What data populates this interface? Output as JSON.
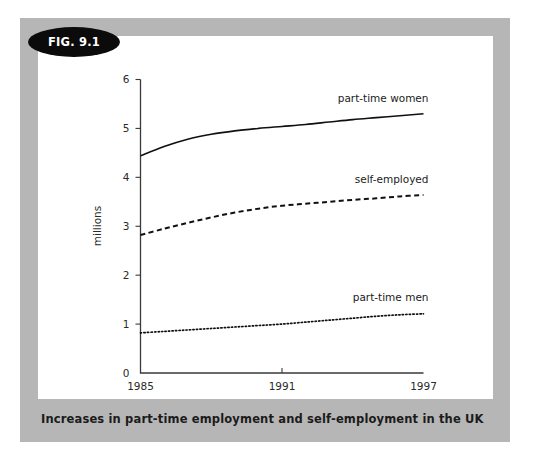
{
  "figure": {
    "badge_label": "FIG. 9.1",
    "caption": "Increases in part-time employment and self-employment in the UK",
    "frame_color": "#b6b6b6",
    "panel_color": "#ffffff",
    "badge_color": "#0b0b0b"
  },
  "chart_data": {
    "type": "line",
    "title": "Increases in part-time employment and self-employment in the UK",
    "xlabel": "",
    "ylabel": "millions",
    "x": [
      1985,
      1986,
      1987,
      1988,
      1989,
      1990,
      1991,
      1992,
      1993,
      1994,
      1995,
      1996,
      1997
    ],
    "xlim": [
      1985,
      1997
    ],
    "ylim": [
      0,
      6
    ],
    "xticks": [
      1985,
      1991,
      1997
    ],
    "xtick_labels": [
      "1985",
      "1991",
      "1997"
    ],
    "yticks": [
      0,
      1,
      2,
      3,
      4,
      5,
      6
    ],
    "ytick_labels": [
      "0",
      "1",
      "2",
      "3",
      "4",
      "5",
      "6"
    ],
    "grid": false,
    "legend": "inline-labels",
    "series": [
      {
        "name": "part-time women",
        "label": "part-time women",
        "style": "solid",
        "color": "#101010",
        "values": [
          4.44,
          4.63,
          4.78,
          4.88,
          4.95,
          5.0,
          5.04,
          5.08,
          5.13,
          5.18,
          5.22,
          5.26,
          5.3
        ]
      },
      {
        "name": "self-employed",
        "label": "self-employed",
        "style": "dashed",
        "color": "#101010",
        "values": [
          2.82,
          2.95,
          3.07,
          3.18,
          3.28,
          3.36,
          3.42,
          3.46,
          3.5,
          3.54,
          3.57,
          3.61,
          3.64
        ]
      },
      {
        "name": "part-time men",
        "label": "part-time men",
        "style": "dotted",
        "color": "#101010",
        "values": [
          0.82,
          0.85,
          0.88,
          0.91,
          0.94,
          0.97,
          1.0,
          1.04,
          1.08,
          1.12,
          1.16,
          1.19,
          1.21
        ]
      }
    ]
  }
}
